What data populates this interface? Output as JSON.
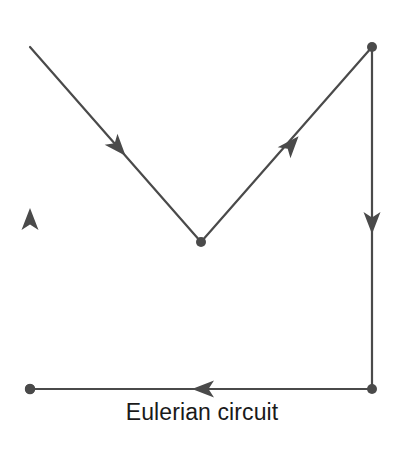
{
  "figure": {
    "caption": "Eulerian circuit",
    "background_color": "#ffffff",
    "stroke_color": "#4a4a4a",
    "node_color": "#4a4a4a",
    "caption_color": "#1a1a1a",
    "width": 404,
    "height": 450
  },
  "chart_data": {
    "type": "diagram",
    "title": "Eulerian circuit",
    "subtitle": "",
    "xlabel": "",
    "ylabel": "",
    "grid": false,
    "legend": "none",
    "xlim": [
      0,
      404
    ],
    "ylim": [
      0,
      450
    ],
    "nodes": [
      {
        "id": "A",
        "label": "",
        "x": 30,
        "y": 47,
        "role": "top-left-vertex",
        "radius": 5
      },
      {
        "id": "B",
        "label": "",
        "x": 201,
        "y": 242,
        "role": "center-apex-vertex",
        "radius": 5
      },
      {
        "id": "C",
        "label": "",
        "x": 372,
        "y": 47,
        "role": "top-right-vertex",
        "radius": 5
      },
      {
        "id": "D",
        "label": "",
        "x": 372,
        "y": 389,
        "role": "bottom-right-vertex",
        "radius": 5
      },
      {
        "id": "E",
        "label": "",
        "x": 30,
        "y": 389,
        "role": "bottom-left-vertex",
        "radius": 5
      }
    ],
    "edges": [
      {
        "id": "e1",
        "from": "E",
        "to": "A",
        "direction": "up",
        "arrow_x": 30,
        "arrow_y": 221,
        "label": ""
      },
      {
        "id": "e2",
        "from": "A",
        "to": "B",
        "direction": "down-right",
        "arrow_x": 117,
        "arrow_y": 146,
        "label": ""
      },
      {
        "id": "e3",
        "from": "B",
        "to": "C",
        "direction": "up-right",
        "arrow_x": 290,
        "arrow_y": 146,
        "label": ""
      },
      {
        "id": "e4",
        "from": "C",
        "to": "D",
        "direction": "down",
        "arrow_x": 372,
        "arrow_y": 221,
        "label": ""
      },
      {
        "id": "e5",
        "from": "D",
        "to": "E",
        "direction": "left",
        "arrow_x": 205,
        "arrow_y": 389,
        "label": ""
      }
    ],
    "circuit_order": [
      "E",
      "A",
      "B",
      "C",
      "D",
      "E"
    ],
    "node_count": 5,
    "edge_count": 5
  }
}
